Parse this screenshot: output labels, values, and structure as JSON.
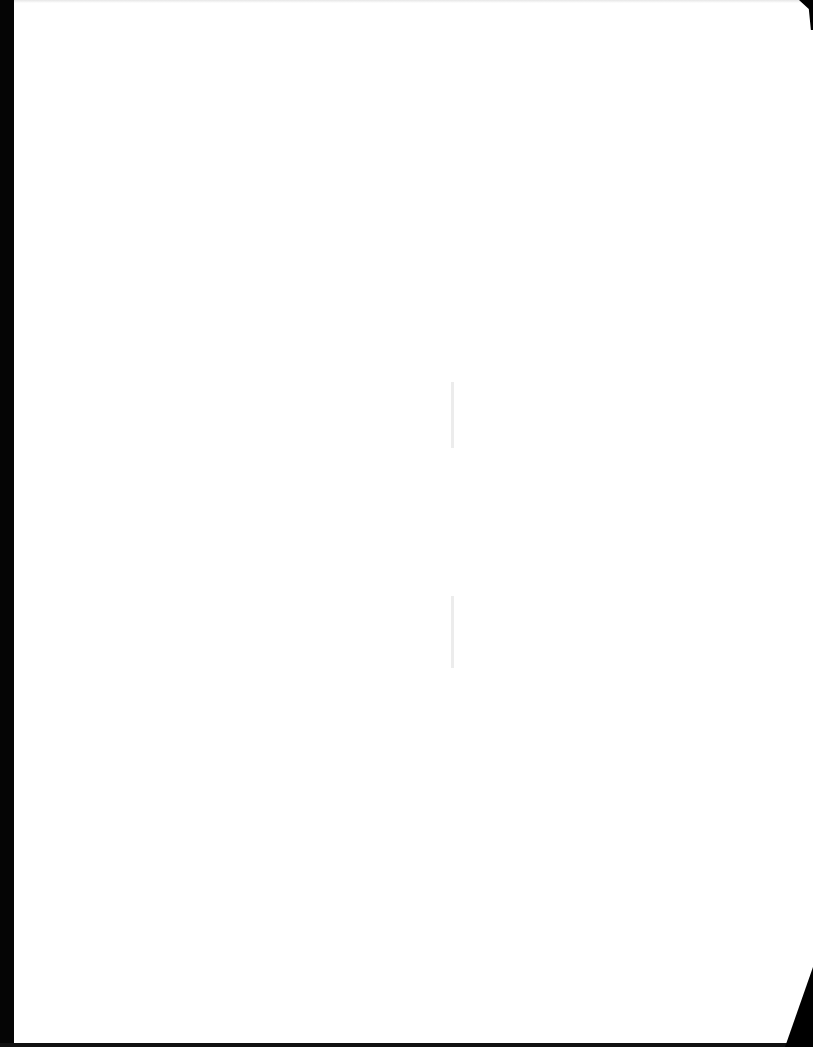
{
  "document": {
    "type": "scanned-page",
    "text": "",
    "content_visible": false
  },
  "colors": {
    "paper": "#ffffff",
    "scan_border": "#050505",
    "showthrough": "#ececec"
  }
}
